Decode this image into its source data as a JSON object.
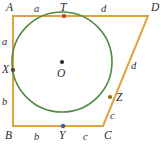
{
  "figure": {
    "type": "geometry-diagram",
    "colors": {
      "polygon": "#e3a33c",
      "circle": "#4f8c3f",
      "point_default": "#2b2b33",
      "point_tangent_top": "#c83c1e",
      "point_tangent_bottom": "#3b5ca8",
      "point_tangent_right": "#8a6a1e",
      "point_tangent_left": "#5a3a2a",
      "label": "#2b2b33",
      "background": "#ffffff"
    },
    "vertices": [
      {
        "name": "A",
        "label": "A",
        "x": 13,
        "y": 16
      },
      {
        "name": "D",
        "label": "D",
        "x": 148,
        "y": 16
      },
      {
        "name": "C",
        "label": "C",
        "x": 103,
        "y": 126
      },
      {
        "name": "B",
        "label": "B",
        "x": 13,
        "y": 126
      }
    ],
    "center": {
      "name": "O",
      "label": "O",
      "x": 62,
      "y": 62,
      "radius": 50
    },
    "tangent_points": [
      {
        "name": "T",
        "label": "T",
        "x": 64,
        "y": 16,
        "edge": "AD"
      },
      {
        "name": "Z",
        "label": "Z",
        "x": 110,
        "y": 97,
        "edge": "DC"
      },
      {
        "name": "Y",
        "label": "Y",
        "x": 63,
        "y": 126,
        "edge": "BC"
      },
      {
        "name": "X",
        "label": "X",
        "x": 13,
        "y": 70,
        "edge": "AB"
      }
    ],
    "side_labels": [
      {
        "name": "AT",
        "label": "a",
        "x": 36,
        "y": 10
      },
      {
        "name": "TD",
        "label": "d",
        "x": 103,
        "y": 10
      },
      {
        "name": "AX",
        "label": "a",
        "x": 3,
        "y": 38
      },
      {
        "name": "XB",
        "label": "b",
        "x": 3,
        "y": 98
      },
      {
        "name": "DZ",
        "label": "d",
        "x": 130,
        "y": 66
      },
      {
        "name": "ZC",
        "label": "c",
        "x": 112,
        "y": 115
      },
      {
        "name": "BY",
        "label": "b",
        "x": 35,
        "y": 134
      },
      {
        "name": "YC",
        "label": "c",
        "x": 83,
        "y": 134
      }
    ]
  }
}
